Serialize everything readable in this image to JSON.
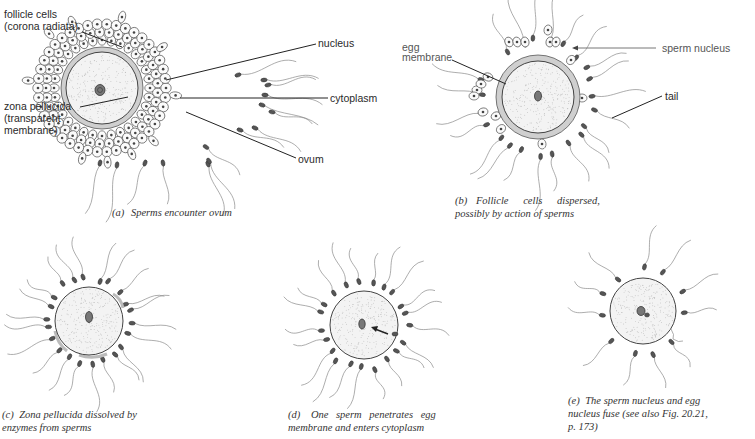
{
  "figure": {
    "panels": [
      {
        "id": "a",
        "caption_letter": "(a)",
        "caption_lines": [
          "Sperms encounter ovum"
        ],
        "center": [
          102,
          88
        ],
        "ovum_radius": 36,
        "zona_radius": 41,
        "follicle_rings": [
          48,
          56,
          64
        ],
        "labels": [
          {
            "text_lines": [
              "follicle cells",
              "(corona radiata)"
            ],
            "x": 4,
            "y": 18,
            "anchor": "start",
            "leader": [
              [
                82,
                32
              ],
              [
                120,
                46
              ]
            ]
          },
          {
            "text_lines": [
              "zona pellucida",
              "(transparent",
              "membrane)"
            ],
            "x": 4,
            "y": 110,
            "anchor": "start",
            "leader": [
              [
                80,
                107
              ],
              [
                130,
                98
              ]
            ]
          },
          {
            "text_lines": [
              "nucleus"
            ],
            "x": 318,
            "y": 46,
            "anchor": "start",
            "leader": [
              [
                316,
                44
              ],
              [
                166,
                82
              ]
            ]
          },
          {
            "text_lines": [
              "cytoplasm"
            ],
            "x": 330,
            "y": 101,
            "anchor": "start",
            "leader": [
              [
                328,
                98
              ],
              [
                182,
                98
              ]
            ]
          },
          {
            "text_lines": [
              "ovum"
            ],
            "x": 298,
            "y": 162,
            "anchor": "start",
            "leader": [
              [
                296,
                158
              ],
              [
                186,
                112
              ]
            ]
          }
        ]
      },
      {
        "id": "b",
        "caption_letter": "(b)",
        "caption_lines": [
          "Follicle cells dispersed,",
          "possibly by action of sperms"
        ],
        "center": [
          538,
          97
        ],
        "ovum_radius": 36,
        "zona_radius": 42,
        "labels": [
          {
            "text_lines": [
              "egg",
              "membrane"
            ],
            "x": 402,
            "y": 51,
            "anchor": "start",
            "leader": [
              [
                455,
                58
              ],
              [
                506,
                82
              ]
            ]
          },
          {
            "text_lines": [
              "sperm nucleus"
            ],
            "x": 662,
            "y": 50,
            "anchor": "start",
            "leader": [
              [
                656,
                48
              ],
              [
                573,
                48
              ]
            ]
          },
          {
            "text_lines": [
              "tail"
            ],
            "x": 665,
            "y": 99,
            "anchor": "start",
            "leader": [
              [
                662,
                96
              ],
              [
                612,
                118
              ]
            ]
          }
        ]
      },
      {
        "id": "c",
        "caption_letter": "(c)",
        "caption_lines": [
          "Zona pellucida dissolved by",
          "enzymes from sperms"
        ],
        "center": [
          89,
          321
        ],
        "ovum_radius": 34
      },
      {
        "id": "d",
        "caption_letter": "(d)",
        "caption_lines": [
          "One sperm penetrates egg",
          "membrane and enters cytoplasm"
        ],
        "center": [
          364,
          325
        ],
        "ovum_radius": 34
      },
      {
        "id": "e",
        "caption_letter": "(e)",
        "caption_lines": [
          "The sperm nucleus and egg",
          "nucleus fuse (see also Fig. 20.21,",
          "p. 173)"
        ],
        "center": [
          643,
          311
        ],
        "ovum_radius": 33
      }
    ]
  },
  "colors": {
    "background": "#ffffff",
    "ink": "#222222",
    "tail": "#8a8a8a",
    "zona": "#cfcfcf"
  }
}
